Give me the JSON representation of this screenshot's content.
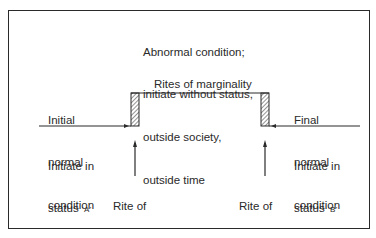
{
  "diagram": {
    "type": "rites-of-passage-schematic",
    "top_note": {
      "lines": [
        "Abnormal condition;",
        "initiate without status,",
        "outside society,",
        "outside time"
      ]
    },
    "marginality_label": "Rites of marginality",
    "left_state": {
      "lines": [
        "Initial",
        "normal",
        "condition"
      ],
      "initiate_line1": "Initiate in",
      "initiate_line2_prefix": "status ",
      "status_code": "'A'"
    },
    "right_state": {
      "lines": [
        "Final",
        "normal",
        "condition"
      ],
      "initiate_line1": "Initiate in",
      "initiate_line2_prefix": "status ",
      "status_code": "'B'"
    },
    "separation_label": [
      "Rite of",
      "separation"
    ],
    "aggregation_label": [
      "Rite of",
      "aggregation"
    ],
    "colors": {
      "line": "#2a2a2a",
      "background": "#ffffff"
    }
  }
}
